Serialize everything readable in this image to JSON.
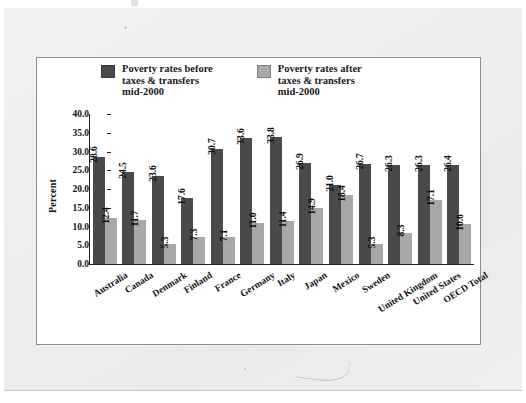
{
  "figure": {
    "ylabel": "Percent",
    "legend": [
      {
        "label": "Poverty rates before\ntaxes & transfers\nmid-2000",
        "swatch": "dark",
        "color": "#4a4a4a"
      },
      {
        "label": "Poverty rates after\ntaxes & transfers\nmid-2000",
        "swatch": "light",
        "color": "#a8a8a8"
      }
    ],
    "annotation_mark": "⌄"
  },
  "chart_data": {
    "type": "bar",
    "title": "",
    "xlabel": "",
    "ylabel": "Percent",
    "ylim": [
      0.0,
      40.0
    ],
    "ytick_step": 5.0,
    "yticks": [
      "40.0",
      "35.0",
      "30.0",
      "25.0",
      "20.0",
      "15.0",
      "10.0",
      "5.0",
      "0.0"
    ],
    "grid": false,
    "legend_position": "top",
    "categories": [
      "Australia",
      "Canada",
      "Denmark",
      "Finland",
      "France",
      "Germany",
      "Italy",
      "Japan",
      "Mexico",
      "Sweden",
      "United Kingdom",
      "United States",
      "OECD Total"
    ],
    "series": [
      {
        "name": "Poverty rates before taxes & transfers mid-2000",
        "color": "#4a4a4a",
        "values": [
          28.6,
          24.5,
          23.6,
          17.6,
          30.7,
          33.6,
          33.8,
          26.9,
          21.0,
          26.7,
          26.3,
          26.3,
          26.4
        ]
      },
      {
        "name": "Poverty rates after taxes & transfers mid-2000",
        "color": "#a8a8a8",
        "values": [
          12.4,
          11.7,
          5.3,
          7.3,
          7.1,
          11.0,
          11.4,
          14.9,
          18.4,
          5.3,
          8.3,
          17.1,
          10.6
        ]
      }
    ]
  }
}
